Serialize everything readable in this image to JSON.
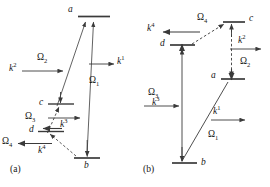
{
  "figure": {
    "background_color": "#ffffff",
    "line_color": "#3a3a3a",
    "text_color": "#161616",
    "width": 270,
    "height": 187
  },
  "panels": [
    {
      "id": "a",
      "caption": "(a)",
      "states": [
        {
          "name": "a",
          "label": "a",
          "x": 90,
          "y": 16
        },
        {
          "name": "c",
          "label": "c",
          "x": 57,
          "y": 103
        },
        {
          "name": "d",
          "label": "d",
          "x": 47,
          "y": 131
        },
        {
          "name": "b",
          "label": "b",
          "x": 88,
          "y": 160
        }
      ],
      "rabi": [
        {
          "name": "omega-1",
          "label": "Ω",
          "sub": "1"
        },
        {
          "name": "omega-2",
          "label": "Ω",
          "sub": "2"
        },
        {
          "name": "omega-3",
          "label": "Ω",
          "sub": "3"
        },
        {
          "name": "omega-4",
          "label": "Ω",
          "sub": "4"
        }
      ],
      "wavevectors": [
        {
          "name": "k-1",
          "label": "k",
          "sup": "1"
        },
        {
          "name": "k-2",
          "label": "k",
          "sup": "2"
        },
        {
          "name": "k-3",
          "label": "k",
          "sup": "3"
        },
        {
          "name": "k-4",
          "label": "k",
          "sup": "4"
        }
      ]
    },
    {
      "id": "b",
      "caption": "(b)",
      "states": [
        {
          "name": "c",
          "label": "c",
          "x": 112,
          "y": 22
        },
        {
          "name": "d",
          "label": "d",
          "x": 29,
          "y": 44
        },
        {
          "name": "a",
          "label": "a",
          "x": 77,
          "y": 78
        },
        {
          "name": "b",
          "label": "b",
          "x": 58,
          "y": 163
        }
      ],
      "rabi": [
        {
          "name": "omega-1",
          "label": "Ω",
          "sub": "1"
        },
        {
          "name": "omega-2",
          "label": "Ω",
          "sub": "2"
        },
        {
          "name": "omega-3",
          "label": "Ω",
          "sub": "3"
        },
        {
          "name": "omega-4",
          "label": "Ω",
          "sub": "4"
        }
      ],
      "wavevectors": [
        {
          "name": "k-1",
          "label": "k",
          "sup": "1"
        },
        {
          "name": "k-2",
          "label": "k",
          "sup": "2"
        },
        {
          "name": "k-3",
          "label": "k",
          "sup": "3"
        },
        {
          "name": "k-4",
          "label": "k",
          "sup": "4"
        }
      ]
    }
  ],
  "a": {
    "state_a": "a",
    "state_b": "b",
    "state_c": "c",
    "state_d": "d",
    "omega1": "Ω",
    "omega1_sub": "1",
    "omega2": "Ω",
    "omega2_sub": "2",
    "omega3": "Ω",
    "omega3_sub": "3",
    "omega4": "Ω",
    "omega4_sub": "4",
    "k1": "k",
    "k1_sup": "1",
    "k2": "k",
    "k2_sup": "2",
    "k3": "k",
    "k3_sup": "3",
    "k4": "k",
    "k4_sup": "4",
    "caption": "(a)"
  },
  "b": {
    "state_a": "a",
    "state_b": "b",
    "state_c": "c",
    "state_d": "d",
    "omega1": "Ω",
    "omega1_sub": "1",
    "omega2": "Ω",
    "omega2_sub": "2",
    "omega3": "Ω",
    "omega3_sub": "3",
    "omega4": "Ω",
    "omega4_sub": "4",
    "k1": "k",
    "k1_sup": "1",
    "k2": "k",
    "k2_sup": "2",
    "k3": "k",
    "k3_sup": "3",
    "k4": "k",
    "k4_sup": "4",
    "caption": "(b)"
  }
}
